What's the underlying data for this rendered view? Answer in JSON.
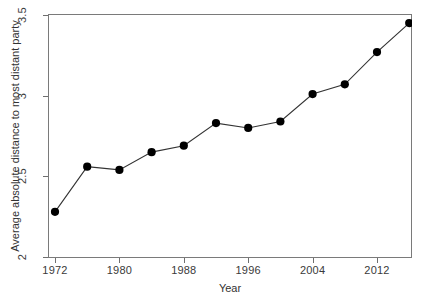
{
  "chart_data": {
    "type": "line",
    "title": "",
    "subtitle": "",
    "xlabel": "Year",
    "ylabel": "Average absolute distance to most distant party",
    "xlim": [
      1970,
      1918
    ],
    "ylim": [
      2,
      3.5
    ],
    "grid": false,
    "legend": "none",
    "marker": "filled-circle",
    "line_color": "#333333",
    "marker_color": "#000000",
    "x_tick_labels": [
      "1972",
      "1980",
      "1988",
      "1996",
      "2004",
      "2012"
    ],
    "x_tick_values": [
      1972,
      1980,
      1988,
      1996,
      2004,
      2012
    ],
    "y_tick_labels": [
      "2",
      "2.5",
      "3",
      "3.5"
    ],
    "y_tick_values": [
      2,
      2.5,
      3,
      3.5
    ],
    "x": [
      1972,
      1976,
      1980,
      1984,
      1988,
      1992,
      1996,
      2000,
      2004,
      2008,
      2012,
      2016
    ],
    "values": [
      2.28,
      2.56,
      2.54,
      2.65,
      2.69,
      2.83,
      2.8,
      2.84,
      3.01,
      3.07,
      3.27,
      3.45
    ],
    "series": [
      {
        "name": "Average absolute distance to most distant party",
        "values": [
          2.28,
          2.56,
          2.54,
          2.65,
          2.69,
          2.83,
          2.8,
          2.84,
          3.01,
          3.07,
          3.27,
          3.45
        ]
      }
    ]
  },
  "axes": {
    "x_title": "Year",
    "y_title": "Average absolute distance to most distant party"
  }
}
